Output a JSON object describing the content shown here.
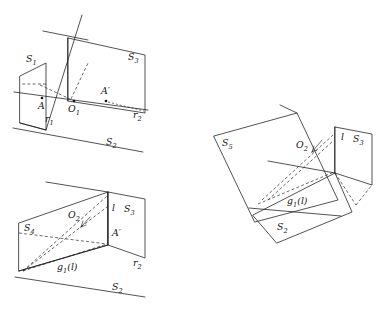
{
  "figure": {
    "background_color": "#ffffff",
    "line_color": "#1a1a1a",
    "diagram_count": 3
  },
  "diagrams": [
    {
      "id": "top-left",
      "name": "diagram-planes-s1-s2-s3",
      "description": "Three planes S1, S2, S3 with lines r1, r2 and points A, O1, A'",
      "labels": [
        {
          "key": "s1",
          "base": "S",
          "sub": "1",
          "x": 26,
          "y": 62,
          "name": "label-s1"
        },
        {
          "key": "s3",
          "base": "S",
          "sub": "3",
          "x": 128,
          "y": 60,
          "name": "label-s3"
        },
        {
          "key": "s2",
          "base": "S",
          "sub": "2",
          "x": 106,
          "y": 145,
          "name": "label-s2"
        },
        {
          "key": "r1",
          "base": "r",
          "sub": "1",
          "x": 45,
          "y": 122,
          "name": "label-r1"
        },
        {
          "key": "r2",
          "base": "r",
          "sub": "2",
          "x": 133,
          "y": 118,
          "name": "label-r2"
        },
        {
          "key": "o1",
          "base": "O",
          "sub": "1",
          "x": 72,
          "y": 110,
          "name": "label-o1"
        },
        {
          "key": "a",
          "base": "A",
          "sub": "",
          "x": 40,
          "y": 107,
          "name": "label-a"
        },
        {
          "key": "a_prime",
          "base": "A′",
          "sub": "",
          "x": 103,
          "y": 93,
          "name": "label-a-prime"
        }
      ],
      "points": [
        {
          "name": "point-a",
          "x": 42,
          "y": 98
        },
        {
          "name": "point-o1",
          "x": 74,
          "y": 101
        },
        {
          "name": "point-a-prime",
          "x": 106,
          "y": 101
        }
      ]
    },
    {
      "id": "bottom-left",
      "name": "diagram-planes-s4-s2-s3",
      "description": "Planes S4, S2, S3 with line l, image g1(l), points O2 and A', line r2",
      "labels": [
        {
          "key": "s4",
          "base": "S",
          "sub": "4",
          "x": 24,
          "y": 231,
          "name": "label-s4"
        },
        {
          "key": "s3",
          "base": "S",
          "sub": "3",
          "x": 131,
          "y": 212,
          "name": "label-s3"
        },
        {
          "key": "s2",
          "base": "S",
          "sub": "2",
          "x": 112,
          "y": 290,
          "name": "label-s2"
        },
        {
          "key": "l",
          "base": "l",
          "sub": "",
          "x": 110,
          "y": 211,
          "name": "label-l"
        },
        {
          "key": "o2",
          "base": "O",
          "sub": "2",
          "x": 72,
          "y": 218,
          "name": "label-o2"
        },
        {
          "key": "a_prime",
          "base": "A′",
          "sub": "",
          "x": 114,
          "y": 234,
          "name": "label-a-prime"
        },
        {
          "key": "r2",
          "base": "r",
          "sub": "2",
          "x": 135,
          "y": 265,
          "name": "label-r2"
        },
        {
          "key": "g1l",
          "base": "g",
          "sub": "1",
          "suffix": "(l)",
          "x": 60,
          "y": 270,
          "name": "label-g1-l"
        }
      ],
      "points": [
        {
          "name": "point-o2",
          "x": 83,
          "y": 226
        },
        {
          "name": "point-a-prime",
          "x": 108,
          "y": 241
        }
      ]
    },
    {
      "id": "right",
      "name": "diagram-planes-s5-s2-s3",
      "description": "Tilted planes S5, S2, S3 with line l, image g1(l) and point O2",
      "labels": [
        {
          "key": "s5",
          "base": "S",
          "sub": "5",
          "x": 222,
          "y": 146,
          "name": "label-s5"
        },
        {
          "key": "s3",
          "base": "S",
          "sub": "3",
          "x": 353,
          "y": 142,
          "name": "label-s3"
        },
        {
          "key": "s2",
          "base": "S",
          "sub": "2",
          "x": 277,
          "y": 230,
          "name": "label-s2"
        },
        {
          "key": "l",
          "base": "l",
          "sub": "",
          "x": 338,
          "y": 140,
          "name": "label-l"
        },
        {
          "key": "o2",
          "base": "O",
          "sub": "2",
          "x": 300,
          "y": 147,
          "name": "label-o2"
        },
        {
          "key": "g1l",
          "base": "g",
          "sub": "1",
          "suffix": "(l)",
          "x": 290,
          "y": 203,
          "name": "label-g1-l"
        }
      ],
      "points": []
    }
  ]
}
